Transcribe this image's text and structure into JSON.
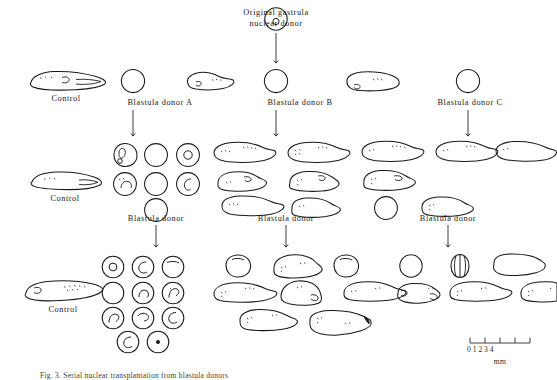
{
  "figure": {
    "title_top": [
      "Original  gastrula",
      "nuclear  donor"
    ],
    "caption": "Fig. 3. Serial nuclear transplantation from blastula donors",
    "scale": {
      "ticks": [
        "0",
        "1",
        "2",
        "3",
        "4"
      ],
      "unit": "mm",
      "tick_values": [
        0,
        1,
        2,
        3,
        4
      ]
    },
    "labels": {
      "control": "Control",
      "donor_a": "Blastula  donor  A",
      "donor_b": "Blastula  donor  B",
      "donor_c": "Blastula  donor  C",
      "donor_plain": "Blastula  donor"
    },
    "colors": {
      "ink": "#1a1a1a",
      "background": "#ffffff",
      "scale_ink": "#2a2a2a"
    },
    "rows": [
      {
        "row": 1,
        "control_label": "Control",
        "donors": [
          "Blastula  donor  A",
          "Blastula  donor  B",
          "Blastula  donor  C"
        ]
      },
      {
        "row": 2,
        "control_label": "Control",
        "donors": [
          "Blastula  donor",
          "Blastula  donor",
          "Blastula  donor"
        ]
      },
      {
        "row": 3,
        "control_label": "Control",
        "donors": []
      }
    ]
  }
}
